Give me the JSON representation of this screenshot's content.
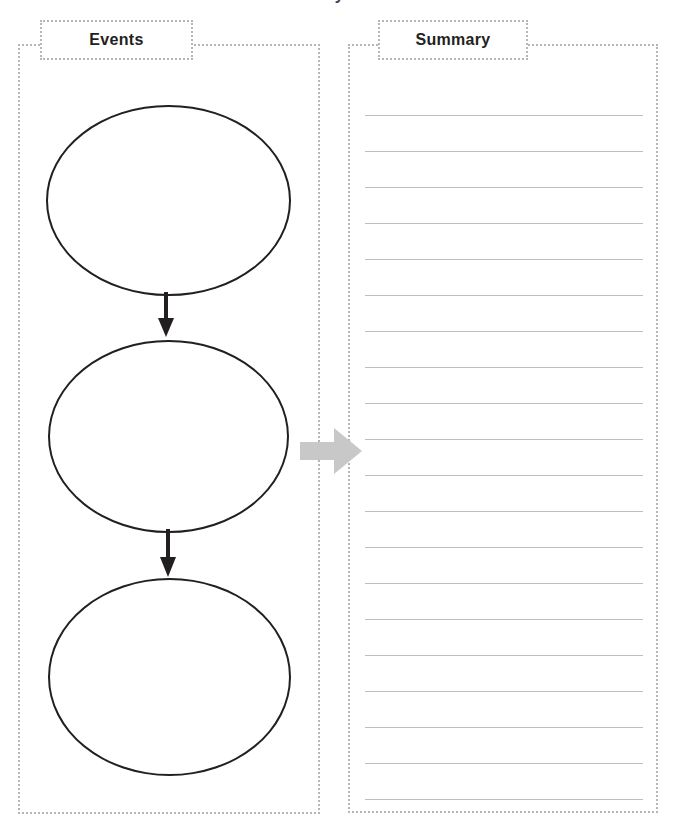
{
  "worksheet": {
    "title": "Find Text Evidence to Summarize the Story",
    "page_background": "#ffffff",
    "dotted_border_color": "#b5b5b5",
    "oval_stroke_color": "#231f20",
    "transition_arrow_color": "#c8c8c8",
    "writing_line_color": "#bfbfbf"
  },
  "events_section": {
    "header_label": "Events",
    "ovals": [
      {
        "id": "event-oval-1",
        "label": ""
      },
      {
        "id": "event-oval-2",
        "label": ""
      },
      {
        "id": "event-oval-3",
        "label": ""
      }
    ],
    "flow_arrows": [
      {
        "id": "flow-arrow-1",
        "direction": "down"
      },
      {
        "id": "flow-arrow-2",
        "direction": "down"
      }
    ]
  },
  "transition": {
    "icon": "right-arrow-icon",
    "direction": "right",
    "color": "#c8c8c8"
  },
  "summary_section": {
    "header_label": "Summary",
    "line_count": 20,
    "first_line_y": 15,
    "line_spacing": 36,
    "lines": [
      "",
      "",
      "",
      "",
      "",
      "",
      "",
      "",
      "",
      "",
      "",
      "",
      "",
      "",
      "",
      "",
      "",
      "",
      "",
      ""
    ]
  }
}
